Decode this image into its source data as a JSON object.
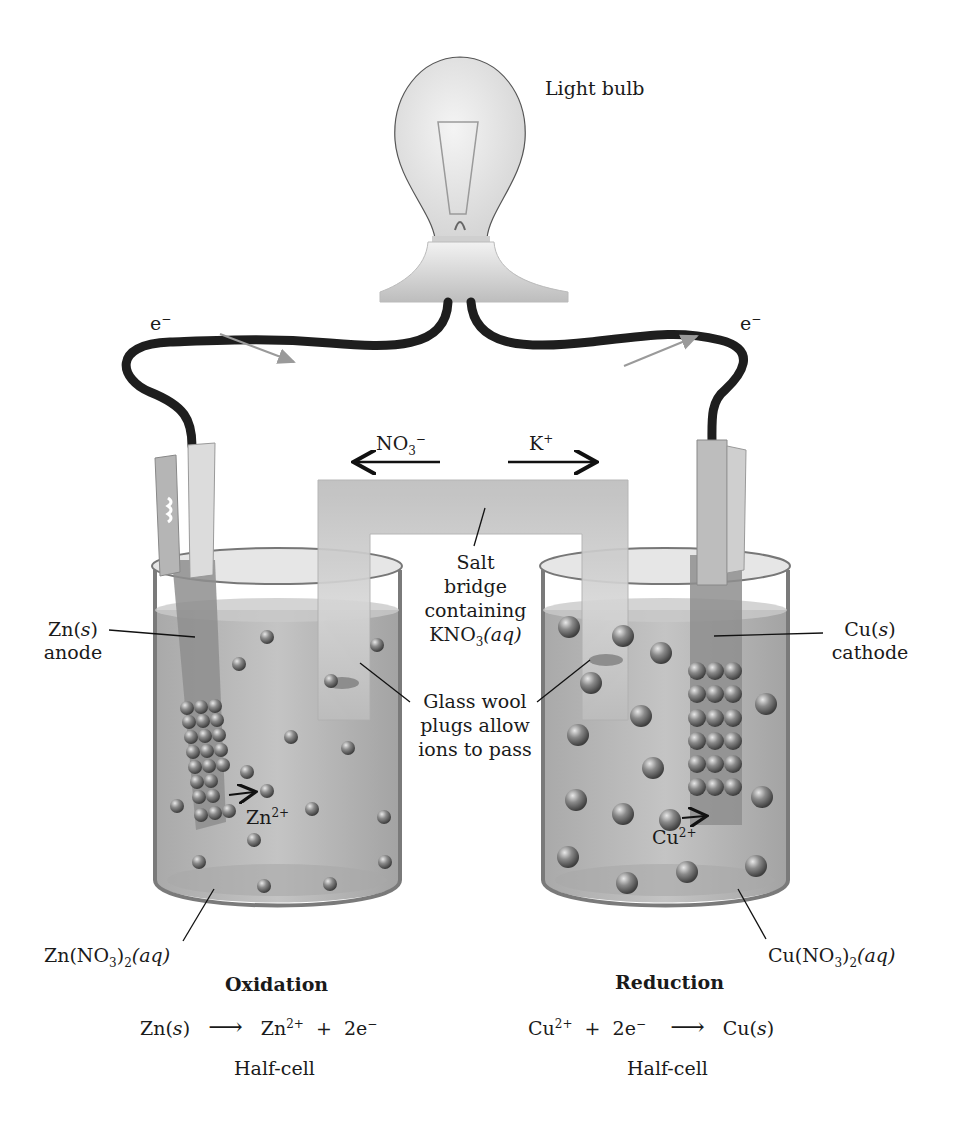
{
  "labels": {
    "light_bulb": "Light bulb",
    "electron_left": "e",
    "electron_right": "e",
    "electron_sup": "−",
    "nitrate_ion": "NO",
    "nitrate_sub": "3",
    "nitrate_sup": "−",
    "potassium_ion": "K",
    "potassium_sup": "+",
    "salt_bridge_line1": "Salt",
    "salt_bridge_line2": "bridge",
    "salt_bridge_line3": "containing",
    "salt_bridge_line4_a": "KNO",
    "salt_bridge_line4_sub": "3",
    "salt_bridge_line4_b": "(aq)",
    "glass_wool_line1": "Glass wool",
    "glass_wool_line2": "plugs allow",
    "glass_wool_line3": "ions to pass",
    "zn_anode_line1_a": "Zn(",
    "zn_anode_line1_i": "s",
    "zn_anode_line1_b": ")",
    "zn_anode_line2": "anode",
    "cu_cathode_line1_a": "Cu(",
    "cu_cathode_line1_i": "s",
    "cu_cathode_line1_b": ")",
    "cu_cathode_line2": "cathode",
    "zn_ion": "Zn",
    "zn_ion_sup": "2+",
    "cu_ion": "Cu",
    "cu_ion_sup": "2+",
    "zn_solution_a": "Zn(NO",
    "zn_solution_sub1": "3",
    "zn_solution_b": ")",
    "zn_solution_sub2": "2",
    "zn_solution_c": "(aq)",
    "cu_solution_a": "Cu(NO",
    "cu_solution_sub1": "3",
    "cu_solution_b": ")",
    "cu_solution_sub2": "2",
    "cu_solution_c": "(aq)"
  },
  "half_cells": {
    "left": {
      "heading": "Oxidation",
      "reactant": "Zn(",
      "reactant_i": "s",
      "reactant_end": ")",
      "arrow": "⟶",
      "product1": "Zn",
      "product1_sup": "2+",
      "plus": "+",
      "product2": "2e",
      "product2_sup": "−",
      "caption": "Half-cell"
    },
    "right": {
      "heading": "Reduction",
      "reactant1": "Cu",
      "reactant1_sup": "2+",
      "plus": "+",
      "reactant2": "2e",
      "reactant2_sup": "−",
      "arrow": "⟶",
      "product": "Cu(",
      "product_i": "s",
      "product_end": ")",
      "caption": "Half-cell"
    }
  },
  "colors": {
    "wire": "#1e1e1e",
    "solution": "#b9b9b9",
    "ion_sphere": "#6a6a6a",
    "electrode": "#8c8c8c",
    "salt_bridge": "#c8c8c8",
    "electron_arrow": "#9a9a9a"
  }
}
